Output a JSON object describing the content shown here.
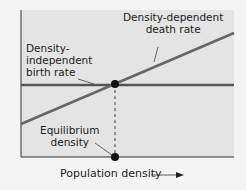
{
  "diagram": {
    "labels": {
      "death_rate": [
        "Density-dependent",
        "death rate"
      ],
      "birth_rate": [
        "Density-",
        "independent",
        "birth rate"
      ],
      "equilibrium": [
        "Equilibrium",
        "density"
      ],
      "x_axis": "Population density"
    },
    "elements": {
      "birth_rate_line": {
        "type": "horizontal",
        "from": [
          21,
          85
        ],
        "to": [
          234,
          85
        ]
      },
      "death_rate_line": {
        "type": "sloped",
        "from": [
          21,
          124
        ],
        "to": [
          234,
          33
        ]
      },
      "equilibrium_point": [
        115,
        84
      ],
      "equilibrium_axis_point": [
        115,
        157
      ]
    },
    "colors": {
      "page_bg": "#f4f4f4",
      "plot_bg": "#e4e4e4",
      "axis": "#333333",
      "birth_line": "#555555",
      "death_line": "#666666",
      "dot": "#111111"
    }
  }
}
